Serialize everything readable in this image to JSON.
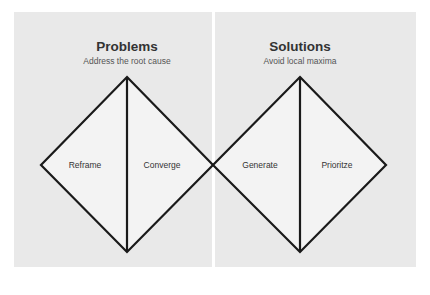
{
  "sections": [
    {
      "title": "Problems",
      "subtitle": "Address the root cause",
      "phases": [
        {
          "label": "Reframe"
        },
        {
          "label": "Converge"
        }
      ]
    },
    {
      "title": "Solutions",
      "subtitle": "Avoid local maxima",
      "phases": [
        {
          "label": "Generate"
        },
        {
          "label": "Prioritze"
        }
      ]
    }
  ],
  "colors": {
    "panel_background": "#e9e9e9",
    "diamond_fill": "#f3f3f3",
    "stroke": "#1a1a1a",
    "divider": "#ffffff"
  }
}
